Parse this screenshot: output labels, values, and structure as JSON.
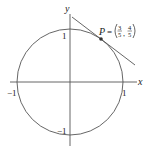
{
  "diagram": {
    "type": "unit-circle-with-tangent",
    "axes": {
      "x_label": "x",
      "y_label": "y"
    },
    "ticks": {
      "x_pos": "1",
      "x_neg": "−1",
      "y_pos": "1",
      "y_neg": "−1"
    },
    "point": {
      "name": "P",
      "equals": "=",
      "x_num": "3",
      "x_den": "5",
      "y_num": "4",
      "y_den": "5",
      "comma": ","
    },
    "colors": {
      "stroke": "#555555",
      "text": "#222222",
      "point": "#333333"
    }
  }
}
